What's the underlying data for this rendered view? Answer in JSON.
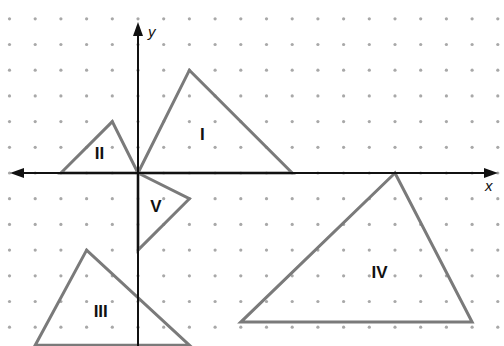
{
  "diagram": {
    "type": "coordinate-plane",
    "grid": "dot",
    "origin_px": [
      138,
      173
    ],
    "unit_px": 25.7,
    "axes": {
      "x_label": "x",
      "y_label": "y"
    },
    "colors": {
      "triangle_stroke": "#7a7a7a",
      "axis": "#111111",
      "dots": "#a8a8a8"
    },
    "triangles": [
      {
        "label": "I",
        "vertices": [
          [
            0,
            0
          ],
          [
            2,
            4
          ],
          [
            6,
            0
          ]
        ],
        "label_pos": [
          2.5,
          1.3
        ]
      },
      {
        "label": "II",
        "vertices": [
          [
            -3,
            0
          ],
          [
            -1,
            2
          ],
          [
            0,
            0
          ]
        ],
        "label_pos": [
          -1.5,
          0.55
        ]
      },
      {
        "label": "III",
        "vertices": [
          [
            -2,
            -3
          ],
          [
            -4,
            -6.7
          ],
          [
            2,
            -6.7
          ]
        ],
        "label_pos": [
          -1.45,
          -5.6
        ]
      },
      {
        "label": "IV",
        "vertices": [
          [
            10,
            0
          ],
          [
            4,
            -5.8
          ],
          [
            13,
            -5.8
          ]
        ],
        "label_pos": [
          9.4,
          -4.1
        ]
      },
      {
        "label": "V",
        "vertices": [
          [
            0,
            0
          ],
          [
            2,
            -1
          ],
          [
            0,
            -3
          ]
        ],
        "label_pos": [
          0.7,
          -1.5
        ]
      }
    ]
  }
}
